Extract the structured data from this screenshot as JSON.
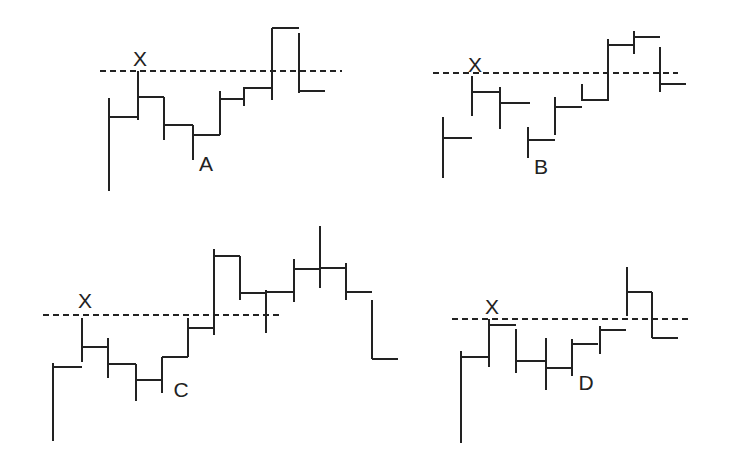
{
  "figure": {
    "ink_color": "#222222",
    "background": "#ffffff"
  },
  "panels": [
    {
      "id": "A",
      "point_label": "X",
      "marker_label": "A",
      "dashed_line": {
        "y": 71,
        "x1": 100,
        "x2": 342
      },
      "x_label_pos": [
        140,
        66
      ],
      "marker_label_pos": [
        206,
        171
      ],
      "bars": [
        {
          "x": 109,
          "y1": 98,
          "y2": 191,
          "tick_y": 117,
          "tick_x2": 137
        },
        {
          "x": 138,
          "y1": 71,
          "y2": 120,
          "tick_y": 97,
          "tick_x2": 164
        },
        {
          "x": 164,
          "y1": 97,
          "y2": 140,
          "tick_y": 125,
          "tick_x2": 193
        },
        {
          "x": 193,
          "y1": 125,
          "y2": 160,
          "tick_y": 135,
          "tick_x2": 220
        },
        {
          "x": 220,
          "y1": 91,
          "y2": 135,
          "tick_y": 99,
          "tick_x2": 244
        },
        {
          "x": 244,
          "y1": 87,
          "y2": 106,
          "tick_y": 88,
          "tick_x2": 271
        },
        {
          "x": 272,
          "y1": 28,
          "y2": 100,
          "tick_y": 28,
          "tick_x2": 299
        },
        {
          "x": 299,
          "y1": 33,
          "y2": 93,
          "tick_y": 91,
          "tick_x2": 325
        }
      ]
    },
    {
      "id": "B",
      "point_label": "X",
      "marker_label": "B",
      "dashed_line": {
        "y": 73,
        "x1": 433,
        "x2": 678
      },
      "x_label_pos": [
        475,
        72
      ],
      "marker_label_pos": [
        541,
        174
      ],
      "bars": [
        {
          "x": 443,
          "y1": 117,
          "y2": 178,
          "tick_y": 138,
          "tick_x2": 472
        },
        {
          "x": 472,
          "y1": 76,
          "y2": 116,
          "tick_y": 92,
          "tick_x2": 500
        },
        {
          "x": 500,
          "y1": 87,
          "y2": 129,
          "tick_y": 103,
          "tick_x2": 530
        },
        {
          "x": 528,
          "y1": 127,
          "y2": 158,
          "tick_y": 140,
          "tick_x2": 555
        },
        {
          "x": 555,
          "y1": 97,
          "y2": 135,
          "tick_y": 107,
          "tick_x2": 582
        },
        {
          "x": 582,
          "y1": 84,
          "y2": 101,
          "tick_y": 100,
          "tick_x2": 608
        },
        {
          "x": 608,
          "y1": 39,
          "y2": 101,
          "tick_y": 45,
          "tick_x2": 634
        },
        {
          "x": 634,
          "y1": 31,
          "y2": 54,
          "tick_y": 37,
          "tick_x2": 660
        },
        {
          "x": 660,
          "y1": 47,
          "y2": 92,
          "tick_y": 84,
          "tick_x2": 686
        }
      ]
    },
    {
      "id": "C",
      "point_label": "X",
      "marker_label": "C",
      "dashed_line": {
        "y": 315,
        "x1": 43,
        "x2": 280
      },
      "x_label_pos": [
        85,
        308
      ],
      "marker_label_pos": [
        181,
        397
      ],
      "bars": [
        {
          "x": 53,
          "y1": 363,
          "y2": 441,
          "tick_y": 367,
          "tick_x2": 82
        },
        {
          "x": 82,
          "y1": 318,
          "y2": 362,
          "tick_y": 347,
          "tick_x2": 108
        },
        {
          "x": 108,
          "y1": 338,
          "y2": 378,
          "tick_y": 364,
          "tick_x2": 136
        },
        {
          "x": 136,
          "y1": 364,
          "y2": 401,
          "tick_y": 380,
          "tick_x2": 161
        },
        {
          "x": 162,
          "y1": 357,
          "y2": 393,
          "tick_y": 357,
          "tick_x2": 188
        },
        {
          "x": 188,
          "y1": 318,
          "y2": 357,
          "tick_y": 328,
          "tick_x2": 214
        },
        {
          "x": 214,
          "y1": 249,
          "y2": 335,
          "tick_y": 256,
          "tick_x2": 240
        },
        {
          "x": 240,
          "y1": 256,
          "y2": 300,
          "tick_y": 293,
          "tick_x2": 266
        },
        {
          "x": 266,
          "y1": 290,
          "y2": 333,
          "tick_y": 292,
          "tick_x2": 294
        },
        {
          "x": 294,
          "y1": 259,
          "y2": 302,
          "tick_y": 269,
          "tick_x2": 320
        },
        {
          "x": 320,
          "y1": 226,
          "y2": 288,
          "tick_y": 268,
          "tick_x2": 346
        },
        {
          "x": 346,
          "y1": 263,
          "y2": 300,
          "tick_y": 292,
          "tick_x2": 372
        },
        {
          "x": 372,
          "y1": 300,
          "y2": 359,
          "tick_y": 359,
          "tick_x2": 398
        }
      ]
    },
    {
      "id": "D",
      "point_label": "X",
      "marker_label": "D",
      "dashed_line": {
        "y": 319,
        "x1": 452,
        "x2": 690
      },
      "x_label_pos": [
        492,
        314
      ],
      "marker_label_pos": [
        586,
        390
      ],
      "bars": [
        {
          "x": 461,
          "y1": 351,
          "y2": 443,
          "tick_y": 357,
          "tick_x2": 488
        },
        {
          "x": 489,
          "y1": 319,
          "y2": 367,
          "tick_y": 325,
          "tick_x2": 516
        },
        {
          "x": 516,
          "y1": 329,
          "y2": 373,
          "tick_y": 361,
          "tick_x2": 545
        },
        {
          "x": 546,
          "y1": 338,
          "y2": 390,
          "tick_y": 368,
          "tick_x2": 571
        },
        {
          "x": 572,
          "y1": 339,
          "y2": 376,
          "tick_y": 344,
          "tick_x2": 598
        },
        {
          "x": 600,
          "y1": 326,
          "y2": 354,
          "tick_y": 330,
          "tick_x2": 626
        },
        {
          "x": 627,
          "y1": 267,
          "y2": 316,
          "tick_y": 292,
          "tick_x2": 652
        },
        {
          "x": 652,
          "y1": 292,
          "y2": 338,
          "tick_y": 338,
          "tick_x2": 678
        }
      ]
    }
  ]
}
